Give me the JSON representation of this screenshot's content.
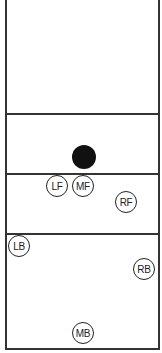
{
  "diagram": {
    "type": "volleyball-court-positions",
    "colors": {
      "line": "#333333",
      "ball": "#111111",
      "background": "#ffffff"
    },
    "ball": {
      "label": "ball",
      "x": 84,
      "y": 157
    },
    "players": [
      {
        "id": "LF",
        "label": "LF",
        "x": 58,
        "y": 187
      },
      {
        "id": "MF",
        "label": "MF",
        "x": 84,
        "y": 187
      },
      {
        "id": "RF",
        "label": "RF",
        "x": 127,
        "y": 203
      },
      {
        "id": "LB",
        "label": "LB",
        "x": 20,
        "y": 247
      },
      {
        "id": "RB",
        "label": "RB",
        "x": 145,
        "y": 270
      },
      {
        "id": "MB",
        "label": "MB",
        "x": 84,
        "y": 334
      }
    ]
  }
}
